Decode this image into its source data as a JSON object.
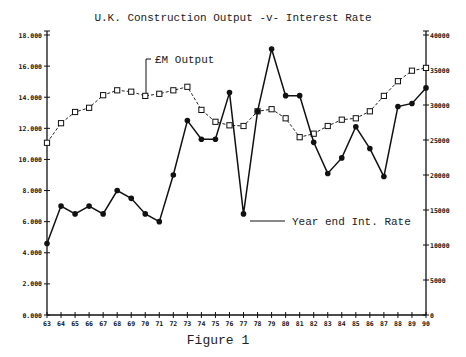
{
  "chart_data": {
    "type": "line",
    "title": "U.K. Construction Output -v- Interest Rate",
    "caption": "Figure 1",
    "xlabel": "",
    "categories": [
      "63",
      "64",
      "65",
      "66",
      "67",
      "68",
      "69",
      "70",
      "71",
      "72",
      "73",
      "74",
      "75",
      "76",
      "77",
      "78",
      "79",
      "80",
      "81",
      "82",
      "83",
      "84",
      "85",
      "86",
      "87",
      "88",
      "89",
      "90"
    ],
    "y_left": {
      "ylim": [
        0,
        18
      ],
      "ticks": [
        0,
        2,
        4,
        6,
        8,
        10,
        12,
        14,
        16,
        18
      ],
      "tick_labels": [
        "0.000",
        "2.000",
        "4.000",
        "6.000",
        "8.000",
        "10.000",
        "12.000",
        "14.000",
        "16.000",
        "18.000"
      ]
    },
    "y_right": {
      "ylim": [
        0,
        40000
      ],
      "ticks": [
        0,
        5000,
        10000,
        15000,
        20000,
        25000,
        30000,
        35000,
        40000
      ],
      "tick_labels": [
        "0",
        "5000",
        "10000",
        "15000",
        "20000",
        "25000",
        "30000",
        "35000",
        "40000"
      ]
    },
    "series": [
      {
        "name": "Year end Int. Rate",
        "axis": "left",
        "marker": "filled-circle",
        "line": "solid",
        "values": [
          4.6,
          7.0,
          6.5,
          7.0,
          6.5,
          8.0,
          7.5,
          6.5,
          6.0,
          9.0,
          12.5,
          11.3,
          11.3,
          14.3,
          6.5,
          13.1,
          17.1,
          14.1,
          14.1,
          11.1,
          9.1,
          10.1,
          12.1,
          10.7,
          8.9,
          13.4,
          13.6,
          14.6
        ]
      },
      {
        "name": "£M Output",
        "axis": "right",
        "marker": "open-square",
        "line": "dashed",
        "values": [
          24600,
          27400,
          29000,
          29600,
          31400,
          32100,
          31900,
          31300,
          31600,
          32100,
          32600,
          29300,
          27600,
          27100,
          27000,
          29100,
          29400,
          28100,
          25400,
          25900,
          27000,
          27900,
          28100,
          29100,
          31300,
          33400,
          34900,
          35300
        ]
      }
    ],
    "annotations": [
      {
        "text": "£M Output",
        "points_to_year": "70",
        "series": "£M Output"
      },
      {
        "text": "Year end Int. Rate",
        "points_to_year": "77",
        "series": "Year end Int. Rate"
      }
    ],
    "grid": false,
    "legend": "inline annotations"
  }
}
